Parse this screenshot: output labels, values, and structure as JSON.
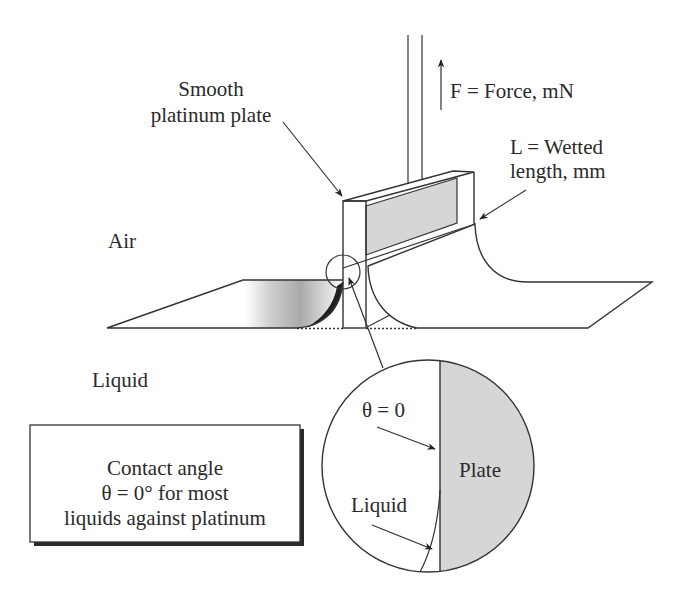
{
  "labels": {
    "plate_label_line1": "Smooth",
    "plate_label_line2": "platinum plate",
    "force_label": "F = Force, mN",
    "wetted_length_line1": "L = Wetted",
    "wetted_length_line2": "length, mm",
    "air_label": "Air",
    "liquid_label": "Liquid"
  },
  "note_box": {
    "lines": [
      "Contact angle",
      "θ = 0° for most",
      "liquids against platinum"
    ]
  },
  "detail_view": {
    "theta_label": "θ = 0",
    "plate_label": "Plate",
    "liquid_label": "Liquid"
  },
  "colors": {
    "line": "#333333",
    "plate_face": "#d6d6d6",
    "background": "#ffffff",
    "shadow": "#2a2a2a"
  }
}
